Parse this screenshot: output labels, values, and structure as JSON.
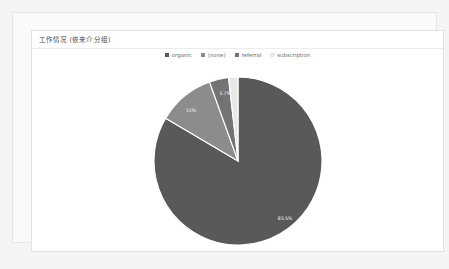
{
  "card": {
    "title": "工作情况 (依来介分组)"
  },
  "legend": {
    "items": [
      {
        "label": "organic",
        "color": "#595959"
      },
      {
        "label": "(none)",
        "color": "#8c8c8c"
      },
      {
        "label": "referral",
        "color": "#737373"
      },
      {
        "label": "subscription",
        "color": "#e8e8e8"
      }
    ]
  },
  "chart_data": {
    "type": "pie",
    "title": "工作情况 (依来介分组)",
    "legend_position": "top-center",
    "labels": [
      "organic",
      "(none)",
      "referral",
      "subscription"
    ],
    "values": [
      83.5,
      11.0,
      3.7,
      1.8
    ],
    "value_labels": [
      "83.5%",
      "11%",
      "3.7%",
      ""
    ],
    "colors": [
      "#595959",
      "#8c8c8c",
      "#737373",
      "#e8e8e8"
    ],
    "units": "percent",
    "start_angle_deg": 0,
    "direction": "clockwise",
    "radius_px": 84,
    "center": {
      "x": 226,
      "y": 142
    },
    "slice_label_positions": [
      {
        "label": "83.5%",
        "x": 47,
        "y": 58,
        "dark": false
      },
      {
        "label": "11%",
        "x": -47,
        "y": -50,
        "dark": false
      },
      {
        "label": "3.7%",
        "x": -13,
        "y": -67,
        "dark": false
      }
    ]
  }
}
